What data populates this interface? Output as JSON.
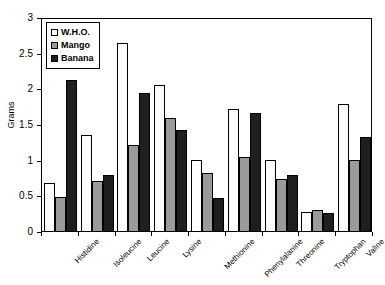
{
  "chart_data": {
    "type": "bar",
    "title": "",
    "subtitle": "",
    "xlabel": "",
    "ylabel": "Grams",
    "ylim": [
      0,
      3
    ],
    "ytick_values": [
      0,
      0.5,
      1,
      1.5,
      2,
      2.5,
      3
    ],
    "ytick_labels": [
      "0",
      "0.5",
      "1",
      "1.5",
      "2",
      "2.5",
      "3"
    ],
    "grid": false,
    "legend_position": "top-left",
    "categories": [
      "Histidine",
      "Isoleucine",
      "Leucine",
      "Lysine",
      "Methionine",
      "Phenylalanine",
      "Threonine",
      "Tryptophan",
      "Valine"
    ],
    "series": [
      {
        "name": "W.H.O.",
        "color": "#ffffff",
        "values": [
          0.67,
          1.35,
          2.64,
          2.04,
          1.0,
          1.71,
          1.0,
          0.26,
          1.78
        ]
      },
      {
        "name": "Mango",
        "color": "#9a9a9a",
        "values": [
          0.47,
          0.7,
          1.2,
          1.58,
          0.82,
          1.04,
          0.73,
          0.3,
          1.0
        ]
      },
      {
        "name": "Banana",
        "color": "#1f1f1f",
        "values": [
          2.12,
          0.78,
          1.93,
          1.42,
          0.46,
          1.66,
          0.78,
          0.25,
          1.32
        ]
      }
    ]
  },
  "legend": {
    "items": [
      {
        "label": "W.H.O.",
        "key": "who"
      },
      {
        "label": "Mango",
        "key": "mango"
      },
      {
        "label": "Banana",
        "key": "banana"
      }
    ]
  },
  "axes": {
    "y_title": "Grams"
  }
}
